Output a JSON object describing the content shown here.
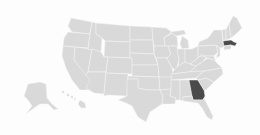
{
  "map": {
    "title": "United States map",
    "colors": {
      "background": "#fdfdfd",
      "state_fill": "#d9d9d9",
      "state_border": "#f4f4f4",
      "highlight_fill": "#4a4a4a"
    },
    "highlighted_states": [
      "Massachusetts",
      "Georgia"
    ],
    "states": [
      {
        "name": "Washington",
        "highlighted": false
      },
      {
        "name": "Oregon",
        "highlighted": false
      },
      {
        "name": "California",
        "highlighted": false
      },
      {
        "name": "Nevada",
        "highlighted": false
      },
      {
        "name": "Idaho",
        "highlighted": false
      },
      {
        "name": "Montana",
        "highlighted": false
      },
      {
        "name": "Wyoming",
        "highlighted": false
      },
      {
        "name": "Utah",
        "highlighted": false
      },
      {
        "name": "Arizona",
        "highlighted": false
      },
      {
        "name": "Colorado",
        "highlighted": false
      },
      {
        "name": "New Mexico",
        "highlighted": false
      },
      {
        "name": "North Dakota",
        "highlighted": false
      },
      {
        "name": "South Dakota",
        "highlighted": false
      },
      {
        "name": "Nebraska",
        "highlighted": false
      },
      {
        "name": "Kansas",
        "highlighted": false
      },
      {
        "name": "Oklahoma",
        "highlighted": false
      },
      {
        "name": "Texas",
        "highlighted": false
      },
      {
        "name": "Minnesota",
        "highlighted": false
      },
      {
        "name": "Iowa",
        "highlighted": false
      },
      {
        "name": "Missouri",
        "highlighted": false
      },
      {
        "name": "Arkansas",
        "highlighted": false
      },
      {
        "name": "Louisiana",
        "highlighted": false
      },
      {
        "name": "Wisconsin",
        "highlighted": false
      },
      {
        "name": "Illinois",
        "highlighted": false
      },
      {
        "name": "Michigan",
        "highlighted": false
      },
      {
        "name": "Indiana",
        "highlighted": false
      },
      {
        "name": "Ohio",
        "highlighted": false
      },
      {
        "name": "Kentucky",
        "highlighted": false
      },
      {
        "name": "Tennessee",
        "highlighted": false
      },
      {
        "name": "Mississippi",
        "highlighted": false
      },
      {
        "name": "Alabama",
        "highlighted": false
      },
      {
        "name": "Georgia",
        "highlighted": true
      },
      {
        "name": "Florida",
        "highlighted": false
      },
      {
        "name": "South Carolina",
        "highlighted": false
      },
      {
        "name": "North Carolina",
        "highlighted": false
      },
      {
        "name": "Virginia",
        "highlighted": false
      },
      {
        "name": "West Virginia",
        "highlighted": false
      },
      {
        "name": "Pennsylvania",
        "highlighted": false
      },
      {
        "name": "New York",
        "highlighted": false
      },
      {
        "name": "Vermont",
        "highlighted": false
      },
      {
        "name": "New Hampshire",
        "highlighted": false
      },
      {
        "name": "Maine",
        "highlighted": false
      },
      {
        "name": "Massachusetts",
        "highlighted": true
      },
      {
        "name": "Connecticut",
        "highlighted": false
      },
      {
        "name": "New Jersey",
        "highlighted": false
      },
      {
        "name": "Maryland",
        "highlighted": false
      },
      {
        "name": "Alaska",
        "highlighted": false
      },
      {
        "name": "Hawaii",
        "highlighted": false
      }
    ]
  }
}
